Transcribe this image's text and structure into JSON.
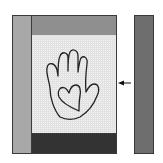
{
  "diagram": {
    "type": "quilt-block-assembly",
    "pieces": {
      "left_strip": {
        "color": "#a8a8a8",
        "x": 12,
        "y": 15,
        "w": 19,
        "h": 139
      },
      "top_strip": {
        "color": "#8f8f8f",
        "x": 31,
        "y": 15,
        "w": 85,
        "h": 20
      },
      "center_panel": {
        "color": "#f2f2f2",
        "x": 31,
        "y": 35,
        "w": 85,
        "h": 98,
        "motif": "hand-with-heart"
      },
      "bottom_strip": {
        "color": "#333333",
        "x": 31,
        "y": 133,
        "w": 85,
        "h": 21
      },
      "right_strip": {
        "color": "#6e6e6e",
        "x": 134,
        "y": 15,
        "w": 20,
        "h": 139
      }
    },
    "arrow": {
      "direction": "left",
      "color": "#111111"
    }
  }
}
